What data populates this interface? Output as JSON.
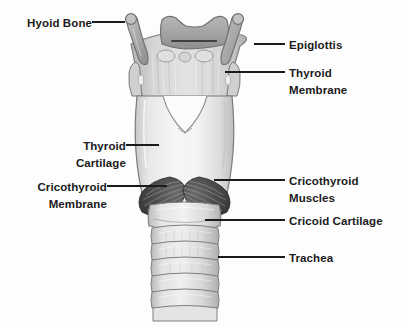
{
  "diagram": {
    "type": "anatomical-illustration",
    "background_color": "#fdfdfd",
    "label_color": "#1b1b1b",
    "line_color": "#1b1b1b",
    "palette": {
      "cartilage_light": "#f0f0ef",
      "cartilage_mid": "#d9d9d8",
      "cartilage_shadow": "#b8b8b7",
      "bone_gray": "#a9a9a8",
      "membrane_gray": "#c9c9c8",
      "muscle_dark": "#4a4a4a",
      "outline": "#6e6e6e"
    },
    "labels": [
      {
        "id": "hyoid-bone",
        "text": "Hyoid Bone",
        "side": "left",
        "x": 14,
        "y": 15,
        "leader": {
          "x1": 92,
          "y1": 22,
          "x2": 124,
          "y2": 22
        }
      },
      {
        "id": "epiglottis",
        "text": "Epiglottis",
        "side": "right",
        "x": 289,
        "y": 37,
        "leader": {
          "x1": 255,
          "y1": 44,
          "x2": 285,
          "y2": 44
        }
      },
      {
        "id": "thyroid-membrane",
        "text": "Thyroid\nMembrane",
        "side": "right",
        "x": 289,
        "y": 65,
        "leader": {
          "x1": 226,
          "y1": 72,
          "x2": 285,
          "y2": 72
        }
      },
      {
        "id": "thyroid-cartilage",
        "text": "Thyroid\nCartilage",
        "side": "left",
        "x": 44,
        "y": 138,
        "leader": {
          "x1": 126,
          "y1": 145,
          "x2": 158,
          "y2": 145
        }
      },
      {
        "id": "cricothyroid-membrane",
        "text": "Cricothyroid\nMembrane",
        "side": "left",
        "x": 14,
        "y": 179,
        "leader": {
          "x1": 107,
          "y1": 186,
          "x2": 166,
          "y2": 186
        }
      },
      {
        "id": "cricothyroid-muscles",
        "text": "Cricothyroid\nMuscles",
        "side": "right",
        "x": 289,
        "y": 173,
        "leader": {
          "x1": 243,
          "y1": 180,
          "x2": 285,
          "y2": 180
        }
      },
      {
        "id": "cricoid-cartilage",
        "text": "Cricoid Cartilage",
        "side": "right",
        "x": 289,
        "y": 213,
        "leader": {
          "x1": 231,
          "y1": 220,
          "x2": 285,
          "y2": 220
        }
      },
      {
        "id": "trachea",
        "text": "Trachea",
        "side": "right",
        "x": 289,
        "y": 250,
        "leader": {
          "x1": 228,
          "y1": 257,
          "x2": 285,
          "y2": 257
        }
      }
    ],
    "structures": [
      {
        "id": "hyoid-bone",
        "name": "Hyoid Bone"
      },
      {
        "id": "epiglottis",
        "name": "Epiglottis"
      },
      {
        "id": "thyrohyoid-membrane",
        "name": "Thyroid Membrane"
      },
      {
        "id": "thyroid-cartilage",
        "name": "Thyroid Cartilage"
      },
      {
        "id": "cricothyroid-membrane",
        "name": "Cricothyroid Membrane"
      },
      {
        "id": "cricothyroid-muscle-left",
        "name": "Cricothyroid Muscle (left)"
      },
      {
        "id": "cricothyroid-muscle-right",
        "name": "Cricothyroid Muscle (right)"
      },
      {
        "id": "cricoid-cartilage",
        "name": "Cricoid Cartilage"
      },
      {
        "id": "trachea",
        "name": "Trachea",
        "ring_count": 6
      }
    ]
  }
}
